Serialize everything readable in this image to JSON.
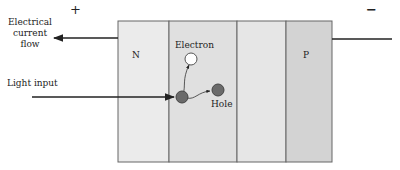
{
  "labels": {
    "plus": "+",
    "minus": "−",
    "current_flow": [
      "Electrical",
      "current",
      "flow"
    ],
    "light_input": "Light input",
    "n_region": "N",
    "p_region": "P",
    "electron": "Electron",
    "hole": "Hole"
  },
  "colors": {
    "n_fill": "#ebebeb",
    "depletion_fill": "#e0e0e0",
    "mid_fill": "#e6e6e6",
    "p_fill": "#d3d3d3",
    "border": "#666666",
    "electron": "#ffffff",
    "hole": "#6a6a6a"
  }
}
